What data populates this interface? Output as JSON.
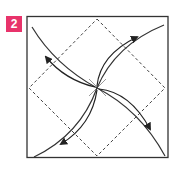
{
  "step": {
    "number": "2",
    "badge_color": "#e8336b"
  },
  "diagram": {
    "square_color": "#333333",
    "dash_color": "#444444",
    "arrow_color": "#222222",
    "icons": [
      "curved-arrow-top-right",
      "curved-arrow-top-left",
      "curved-arrow-bottom-right",
      "curved-arrow-bottom-left",
      "center-crease-x"
    ]
  }
}
